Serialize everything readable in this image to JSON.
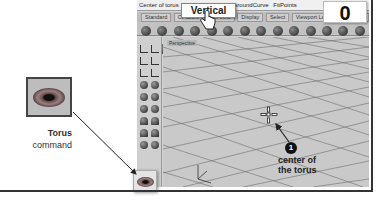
{
  "command_bar": {
    "prompt": "Center of torus",
    "options": [
      "Vertical",
      "Tangent",
      "AroundCurve",
      "FitPoints"
    ]
  },
  "toolbar_tabs": [
    "Standard",
    "CPlanes",
    "Set View",
    "Display",
    "Select",
    "Viewport Layout",
    "Visibility"
  ],
  "callout": {
    "vertical_label": "Vertical",
    "count": "0"
  },
  "viewport": {
    "label": "Perspective"
  },
  "torus_command": {
    "title": "Torus",
    "subtitle": "command",
    "icon": "torus-icon"
  },
  "annotation": {
    "marker_number": "1",
    "label": "center of the torus"
  },
  "colors": {
    "frame": "#333333",
    "viewport_bg": "#c9c9c9",
    "grid_line": "#555555",
    "marker": "#111111"
  }
}
